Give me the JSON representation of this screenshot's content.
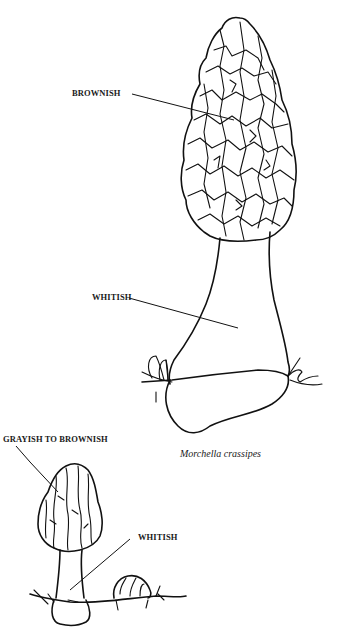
{
  "figure": {
    "caption": "Morchella crassipes",
    "large_specimen": {
      "labels": [
        {
          "id": "cap",
          "text": "BROWNISH"
        },
        {
          "id": "stem",
          "text": "WHITISH"
        }
      ]
    },
    "small_specimen": {
      "labels": [
        {
          "id": "cap",
          "text": "GRAYISH TO BROWNISH"
        },
        {
          "id": "stem",
          "text": "WHITISH"
        }
      ]
    },
    "colors": {
      "background": "#ffffff",
      "ink": "#111111"
    }
  }
}
